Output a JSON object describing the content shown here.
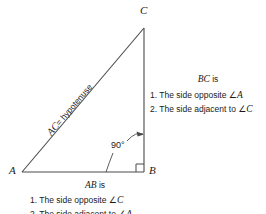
{
  "figure": {
    "type": "right-triangle-diagram",
    "stroke_color": "#4a4a4a",
    "text_color": "#1a1a1a",
    "background": "#ffffff",
    "vertices": {
      "A": {
        "label": "A",
        "x": 22,
        "y": 172
      },
      "B": {
        "label": "B",
        "x": 144,
        "y": 172
      },
      "C": {
        "label": "C",
        "x": 144,
        "y": 28
      }
    },
    "sides": {
      "hypotenuse": {
        "name": "AC",
        "label_italic": "AC",
        "label_plain": "= hypotenuse"
      },
      "vertical": {
        "name": "BC"
      },
      "base": {
        "name": "AB"
      }
    },
    "right_angle": {
      "at_vertex": "B",
      "label": "90°",
      "marker": "square"
    }
  },
  "notes": {
    "bc": {
      "heading_italic": "BC",
      "heading_plain": "is",
      "items": [
        {
          "number": "1.",
          "text_before": "The side opposite",
          "angle": "∠",
          "vertex": "A"
        },
        {
          "number": "2.",
          "text_before": "The side adjacent to",
          "angle": "∠",
          "vertex": "C"
        }
      ]
    },
    "ab": {
      "heading_italic": "AB",
      "heading_plain": "is",
      "items": [
        {
          "number": "1.",
          "text_before": "The side opposite",
          "angle": "∠",
          "vertex": "C"
        },
        {
          "number": "2.",
          "text_before": "The side adjacent to",
          "angle": "∠",
          "vertex": "A"
        }
      ]
    }
  }
}
